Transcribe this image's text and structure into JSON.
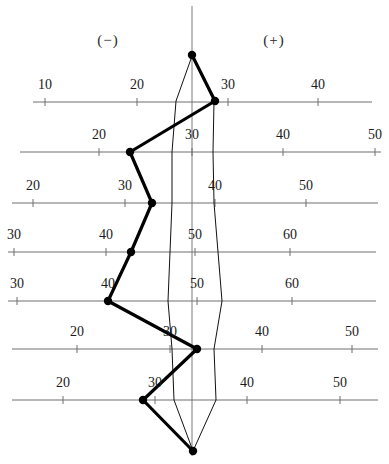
{
  "figure": {
    "width": 389,
    "height": 464,
    "colors": {
      "axis": "#6f6f6f",
      "outline": "#111111",
      "profile": "#000000",
      "text": "#1b1b1b",
      "background": "#ffffff"
    }
  },
  "sign_labels": {
    "negative": "(−)",
    "negative_x": 108,
    "negative_y": 45,
    "positive": "(+)",
    "positive_x": 274,
    "positive_y": 45
  },
  "center_line": {
    "x": 192,
    "y_top": 6,
    "y_bottom": 456
  },
  "chart_data": {
    "type": "line",
    "xlabel": "",
    "ylabel": "",
    "grid": false,
    "legend": "none",
    "annotations": [
      "(−)",
      "(+)"
    ],
    "axis_rows": [
      {
        "row": 1,
        "y": 102,
        "x_start": 33,
        "x_end": 372,
        "tick_labels": [
          "10",
          "20",
          "30",
          "40"
        ],
        "tick_values": [
          10,
          20,
          30,
          40
        ],
        "tick_x": [
          45,
          137,
          228,
          318
        ],
        "label_y": 89
      },
      {
        "row": 2,
        "y": 152,
        "x_start": 20,
        "x_end": 381,
        "tick_labels": [
          "20",
          "30",
          "40",
          "50"
        ],
        "tick_values": [
          20,
          30,
          40,
          50
        ],
        "tick_x": [
          99,
          192,
          283,
          375
        ],
        "label_y": 139
      },
      {
        "row": 3,
        "y": 203,
        "x_start": 12,
        "x_end": 378,
        "tick_labels": [
          "20",
          "30",
          "40",
          "50"
        ],
        "tick_values": [
          20,
          30,
          40,
          50
        ],
        "tick_x": [
          33,
          125,
          215,
          306
        ],
        "label_y": 190
      },
      {
        "row": 4,
        "y": 252,
        "x_start": 8,
        "x_end": 376,
        "tick_labels": [
          "30",
          "40",
          "50",
          "60"
        ],
        "tick_values": [
          30,
          40,
          50,
          60
        ],
        "tick_x": [
          14,
          106,
          195,
          290
        ],
        "label_y": 239
      },
      {
        "row": 5,
        "y": 301,
        "x_start": 8,
        "x_end": 376,
        "tick_labels": [
          "30",
          "40",
          "50",
          "60"
        ],
        "tick_values": [
          30,
          40,
          50,
          60
        ],
        "tick_x": [
          17,
          108,
          197,
          292
        ],
        "label_y": 288
      },
      {
        "row": 6,
        "y": 349,
        "x_start": 12,
        "x_end": 378,
        "tick_labels": [
          "20",
          "30",
          "40",
          "50"
        ],
        "tick_values": [
          20,
          30,
          40,
          50
        ],
        "tick_x": [
          77,
          170,
          262,
          352
        ],
        "label_y": 336
      },
      {
        "row": 7,
        "y": 400,
        "x_start": 12,
        "x_end": 378,
        "tick_labels": [
          "20",
          "30",
          "40",
          "50"
        ],
        "tick_values": [
          20,
          30,
          40,
          50
        ],
        "tick_x": [
          63,
          155,
          247,
          340
        ],
        "label_y": 387
      }
    ],
    "profile_points": [
      {
        "label": "P0",
        "x": 192,
        "y": 55,
        "row": 0,
        "value": null
      },
      {
        "label": "P1",
        "x": 215,
        "y": 101,
        "row": 1,
        "value": 29
      },
      {
        "label": "P2",
        "x": 130,
        "y": 152,
        "row": 2,
        "value": 23
      },
      {
        "label": "P3",
        "x": 152,
        "y": 203,
        "row": 3,
        "value": 33
      },
      {
        "label": "P4",
        "x": 131,
        "y": 252,
        "row": 4,
        "value": 43
      },
      {
        "label": "P5",
        "x": 108,
        "y": 301,
        "row": 5,
        "value": 40
      },
      {
        "label": "P6",
        "x": 197,
        "y": 349,
        "row": 6,
        "value": 33
      },
      {
        "label": "P7",
        "x": 143,
        "y": 400,
        "row": 7,
        "value": 29
      },
      {
        "label": "P8",
        "x": 193,
        "y": 451,
        "row": 8,
        "value": null
      }
    ],
    "outline_left": [
      {
        "x": 192,
        "y": 56
      },
      {
        "x": 176,
        "y": 101
      },
      {
        "x": 172,
        "y": 152
      },
      {
        "x": 172,
        "y": 203
      },
      {
        "x": 170,
        "y": 252
      },
      {
        "x": 168,
        "y": 301
      },
      {
        "x": 172,
        "y": 349
      },
      {
        "x": 174,
        "y": 400
      },
      {
        "x": 193,
        "y": 451
      }
    ],
    "outline_right": [
      {
        "x": 192,
        "y": 56
      },
      {
        "x": 214,
        "y": 101
      },
      {
        "x": 213,
        "y": 152
      },
      {
        "x": 214,
        "y": 203
      },
      {
        "x": 218,
        "y": 252
      },
      {
        "x": 222,
        "y": 301
      },
      {
        "x": 214,
        "y": 349
      },
      {
        "x": 216,
        "y": 400
      },
      {
        "x": 193,
        "y": 451
      }
    ]
  }
}
